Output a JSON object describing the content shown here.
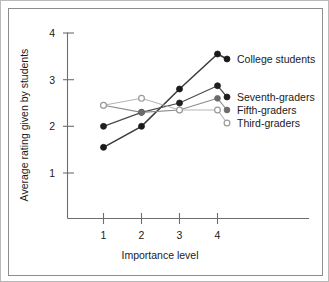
{
  "chart_data": {
    "type": "line",
    "title": "",
    "xlabel": "Importance level",
    "ylabel": "Average rating given by students",
    "x": [
      1,
      2,
      3,
      4
    ],
    "categories": [
      "1",
      "2",
      "3",
      "4"
    ],
    "xticklabels": [
      "1",
      "2",
      "3",
      "4"
    ],
    "yticklabels": [
      "1",
      "2",
      "3",
      "4"
    ],
    "xlim": [
      0.6,
      4.45
    ],
    "ylim": [
      0.45,
      4.1
    ],
    "grid": false,
    "legend_position": "right-inline-labels",
    "series": [
      {
        "name": "College students",
        "values": [
          1.55,
          2.0,
          2.8,
          3.55
        ],
        "marker": "filled-circle",
        "color": "#1a1a1a",
        "line_color": "#3a3a3a",
        "line_width": 1.5
      },
      {
        "name": "Seventh-graders",
        "values": [
          2.0,
          2.3,
          2.5,
          2.87
        ],
        "marker": "filled-circle",
        "color": "#1f1f1f",
        "line_color": "#4a4a4a",
        "line_width": 1.2
      },
      {
        "name": "Fifth-graders",
        "values": [
          2.45,
          2.3,
          2.35,
          2.6
        ],
        "marker": "gray-filled-circle",
        "color": "#6b6b6b",
        "line_color": "#8a8a8a",
        "line_width": 1.1
      },
      {
        "name": "Third-graders",
        "values": [
          2.45,
          2.6,
          2.35,
          2.35
        ],
        "marker": "open-circle",
        "color": "#9a9a9a",
        "line_color": "#b5b5b5",
        "line_width": 1.1
      }
    ]
  },
  "legend": {
    "items": [
      {
        "label": "College students"
      },
      {
        "label": "Seventh-graders"
      },
      {
        "label": "Fifth-graders"
      },
      {
        "label": "Third-graders"
      }
    ]
  },
  "axes": {
    "y_title": "Average rating given by students",
    "x_title": "Importance level",
    "y_ticks": [
      "4",
      "3",
      "2",
      "1"
    ],
    "x_ticks": [
      "1",
      "2",
      "3",
      "4"
    ]
  },
  "colors": {
    "frame_outer": "#b9b9b9",
    "frame_inner": "#8d8d8d",
    "axis": "#6e6e6e",
    "text": "#1a1a1a",
    "background": "#ffffff"
  }
}
